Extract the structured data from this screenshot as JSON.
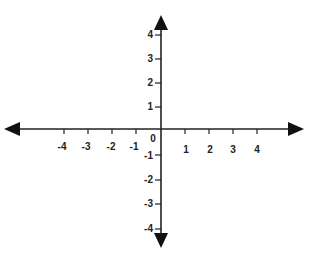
{
  "diagram": {
    "type": "coordinate-plane",
    "axis_color": "#222222",
    "background": "#ffffff",
    "origin_label": "0",
    "x_axis": {
      "ticks": [
        -4,
        -3,
        -2,
        -1,
        1,
        2,
        3,
        4
      ],
      "labels": [
        "-4",
        "-3",
        "-2",
        "-1",
        "1",
        "2",
        "3",
        "4"
      ],
      "arrows": [
        "left",
        "right"
      ]
    },
    "y_axis": {
      "ticks": [
        4,
        3,
        2,
        1,
        -1,
        -2,
        -3,
        -4
      ],
      "labels": [
        "4",
        "3",
        "2",
        "1",
        "-1",
        "-2",
        "-3",
        "-4"
      ],
      "arrows": [
        "up",
        "down"
      ]
    }
  }
}
